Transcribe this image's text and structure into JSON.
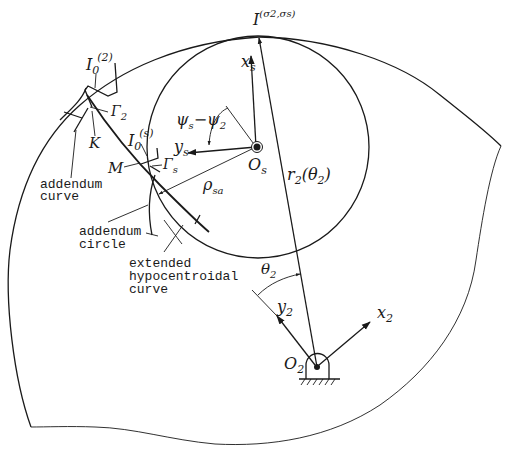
{
  "figure": {
    "symbols": {
      "instant_center": "I",
      "instant_center_sup": "(σ2,σs)",
      "i0_2": "I",
      "i0_2_sub": "0",
      "i0_2_sup": "(2)",
      "i0_s": "I",
      "i0_s_sub": "0",
      "i0_s_sup": "(s)",
      "gamma_2": "Γ",
      "gamma_2_sub": "2",
      "gamma_s": "Γ",
      "gamma_s_sub": "s",
      "K": "K",
      "M": "M",
      "xs": "x",
      "xs_sub": "s",
      "ys": "y",
      "ys_sub": "s",
      "Os": "O",
      "Os_sub": "s",
      "psi": "ψ",
      "psi_sub1": "s",
      "psi_minus": "−ψ",
      "psi_sub2": "2",
      "rho": "ρ",
      "rho_sub": "sa",
      "r2": "r",
      "r2_sub": "2",
      "r2_arg": "(θ",
      "r2_arg_sub": "2",
      "r2_close": ")",
      "theta2": "θ",
      "theta2_sub": "2",
      "y2": "y",
      "y2_sub": "2",
      "x2": "x",
      "x2_sub": "2",
      "O2": "O",
      "O2_sub": "2"
    },
    "annotations": {
      "addendum_curve": [
        "addendum",
        "curve"
      ],
      "addendum_circle": [
        "addendum",
        "circle"
      ],
      "extended_hypocentroidal_curve": [
        "extended",
        "hypocentroidal",
        "curve"
      ]
    },
    "colors": {
      "stroke": "#1a1a1a",
      "background": "#ffffff"
    }
  }
}
